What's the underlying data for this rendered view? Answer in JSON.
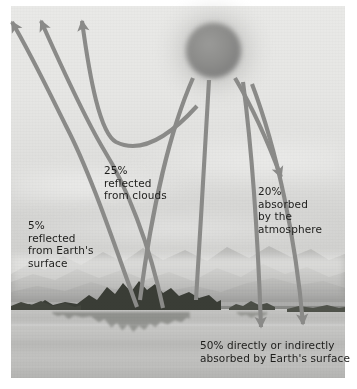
{
  "diagram": {
    "scene": "grayscale photograph of a lake with a forested island and distant mountains under a hazy sky",
    "sun": {
      "name": "sun"
    },
    "colors": {
      "arrow": "#8a8a88",
      "text": "#1d1d1b",
      "sky": "#e8e8e6",
      "water": "#c2c2c0",
      "island": "#3a3d36",
      "sun": "#8d8d8b"
    },
    "labels": {
      "reflected_surface": "5%\nreflected\nfrom Earth's\nsurface",
      "reflected_clouds": "25%\nreflected\nfrom clouds",
      "absorbed_atmosphere": "20%\nabsorbed\nby the\natmosphere",
      "absorbed_surface": "50% directly or indirectly\nabsorbed by Earth's surface"
    },
    "values": {
      "reflected_surface_pct": "5%",
      "reflected_clouds_pct": "25%",
      "absorbed_atmosphere_pct": "20%",
      "absorbed_surface_pct": "50%"
    },
    "arrows": [
      {
        "name": "reflected-surface-arrow-1",
        "direction": "up-left"
      },
      {
        "name": "reflected-surface-arrow-2",
        "direction": "up-left"
      },
      {
        "name": "reflected-clouds-arrow",
        "direction": "up-left"
      },
      {
        "name": "incoming-arrow-left",
        "direction": "down-left"
      },
      {
        "name": "incoming-arrow-center",
        "direction": "down"
      },
      {
        "name": "absorbed-atmosphere-arrow",
        "direction": "down-right"
      },
      {
        "name": "absorbed-surface-arrow-1",
        "direction": "down"
      },
      {
        "name": "absorbed-surface-arrow-2",
        "direction": "down"
      }
    ]
  }
}
